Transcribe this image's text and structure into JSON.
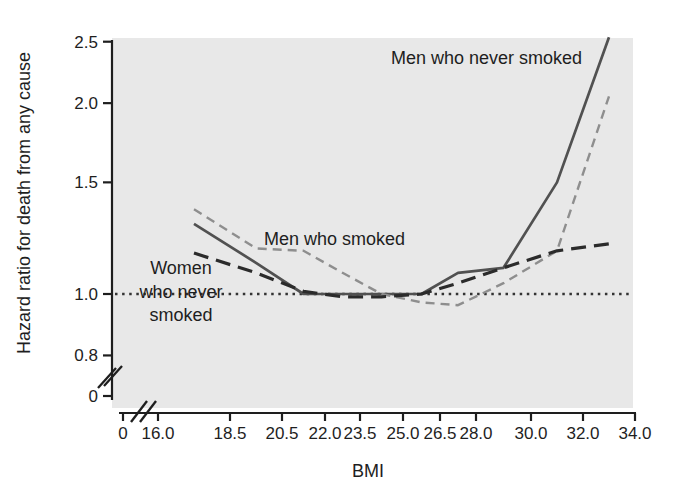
{
  "chart_data": {
    "type": "line",
    "title": "",
    "xlabel": "BMI",
    "ylabel": "Hazard ratio for death from any cause",
    "x_note": "BMI category midpoints",
    "x": [
      17.25,
      19.5,
      21.25,
      22.75,
      24.25,
      25.75,
      27.25,
      29,
      31,
      33
    ],
    "series": [
      {
        "name": "Men who never smoked",
        "line_style": "solid",
        "color": "#515151",
        "values": [
          1.29,
          1.12,
          1.0,
          1.0,
          1.0,
          1.0,
          1.08,
          1.1,
          1.5,
          2.54
        ]
      },
      {
        "name": "Men who smoked",
        "line_style": "short-dash",
        "color": "#8e8e8e",
        "values": [
          1.36,
          1.18,
          1.17,
          1.08,
          1.0,
          0.97,
          0.96,
          1.04,
          1.17,
          2.05
        ]
      },
      {
        "name": "Women who never smoked",
        "line_style": "long-dash",
        "color": "#2b2b2b",
        "values": [
          1.16,
          1.08,
          1.01,
          0.99,
          0.99,
          1.0,
          1.04,
          1.1,
          1.17,
          1.2
        ]
      }
    ],
    "reference_line": {
      "value": 1.0,
      "style": "dotted",
      "color": "#333333"
    },
    "x_ticks": [
      "0",
      "16.0",
      "18.5",
      "20.5",
      "22.0",
      "23.5",
      "25.0",
      "26.5",
      "28.0",
      "30.0",
      "32.0",
      "34.0"
    ],
    "y_ticks": [
      "2.5",
      "2.0",
      "1.5",
      "1.0",
      "0.8",
      "0"
    ],
    "y_scale": "log",
    "xlim": [
      16,
      34
    ],
    "ylim": [
      0.8,
      2.5
    ],
    "axis_breaks": {
      "x": true,
      "y": true
    },
    "grid": false,
    "legend_position": "inline-annotations",
    "annotations": [
      {
        "text": "Men who never smoked",
        "lines": [
          "Men who never smoked"
        ]
      },
      {
        "text": "Men who smoked",
        "lines": [
          "Men who smoked"
        ]
      },
      {
        "text": "Women who never smoked",
        "lines": [
          "Women",
          "who never",
          "smoked"
        ]
      }
    ],
    "plot_background": "#e8e8e8",
    "page_background": "#ffffff"
  }
}
